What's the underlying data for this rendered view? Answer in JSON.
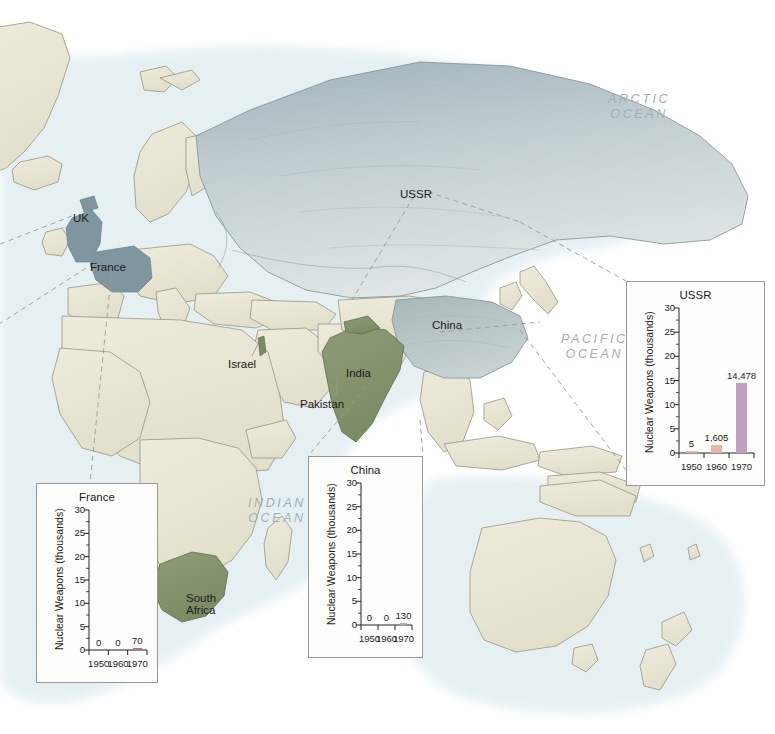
{
  "map": {
    "ocean_labels": [
      {
        "name": "arctic-ocean-label",
        "text": "ARCTIC\nOCEAN",
        "x": 608,
        "y": 92
      },
      {
        "name": "pacific-ocean-label",
        "text": "PACIFIC\nOCEAN",
        "x": 561,
        "y": 332
      },
      {
        "name": "indian-ocean-label",
        "text": "INDIAN\nOCEAN",
        "x": 248,
        "y": 496
      }
    ],
    "country_labels": [
      {
        "name": "country-label-uk",
        "text": "UK",
        "x": 73,
        "y": 212
      },
      {
        "name": "country-label-france",
        "text": "France",
        "x": 90,
        "y": 261
      },
      {
        "name": "country-label-israel",
        "text": "Israel",
        "x": 228,
        "y": 358
      },
      {
        "name": "country-label-ussr",
        "text": "USSR",
        "x": 400,
        "y": 188
      },
      {
        "name": "country-label-china",
        "text": "China",
        "x": 432,
        "y": 319
      },
      {
        "name": "country-label-india",
        "text": "India",
        "x": 346,
        "y": 367
      },
      {
        "name": "country-label-pakistan",
        "text": "Pakistan",
        "x": 300,
        "y": 398
      },
      {
        "name": "country-label-south-africa",
        "text": "South\nAfrica",
        "x": 186,
        "y": 592
      }
    ],
    "colors": {
      "ocean": "#ffffff",
      "coastal_water": "#e4f0f3",
      "land": "#e8e4d3",
      "land_border": "#8f8f7e",
      "highlight_blue": "#8fa3ac",
      "highlight_green": "#7e8f6a",
      "leader_line": "#9a9a96"
    }
  },
  "charts": [
    {
      "panel": "ussr-chart-panel",
      "x": 626,
      "y": 281,
      "w": 139,
      "h": 205,
      "chart_data": {
        "type": "bar",
        "title": "USSR",
        "ylabel": "Nuclear Weapons (thousands)",
        "xlabel": "",
        "categories": [
          "1950",
          "1960",
          "1970"
        ],
        "values": [
          5,
          1605,
          14478
        ],
        "value_labels": [
          "5",
          "1,605",
          "14,478"
        ],
        "yticks": [
          0,
          5,
          10,
          15,
          20,
          25,
          30
        ],
        "ylim": [
          0,
          30
        ],
        "unit_scale": 1000,
        "grid": false,
        "legend": "none",
        "bar_colors": [
          "#e8b4a4",
          "#e8b4a4",
          "#bfa0bf"
        ]
      }
    },
    {
      "panel": "china-chart-panel",
      "x": 308,
      "y": 456,
      "w": 115,
      "h": 202,
      "chart_data": {
        "type": "bar",
        "title": "China",
        "ylabel": "Nuclear Weapons (thousands)",
        "xlabel": "",
        "categories": [
          "1950",
          "1960",
          "1970"
        ],
        "values": [
          0,
          0,
          130
        ],
        "value_labels": [
          "0",
          "0",
          "130"
        ],
        "yticks": [
          0,
          5,
          10,
          15,
          20,
          25,
          30
        ],
        "ylim": [
          0,
          30
        ],
        "unit_scale": 1000,
        "grid": false,
        "legend": "none",
        "bar_colors": [
          "#e8b4a4",
          "#e8b4a4",
          "#bfa0bf"
        ]
      }
    },
    {
      "panel": "france-chart-panel",
      "x": 36,
      "y": 483,
      "w": 122,
      "h": 200,
      "chart_data": {
        "type": "bar",
        "title": "France",
        "ylabel": "Nuclear Weapons (thousands)",
        "xlabel": "",
        "categories": [
          "1950",
          "1960",
          "1970"
        ],
        "values": [
          0,
          0,
          70
        ],
        "value_labels": [
          "0",
          "0",
          "70"
        ],
        "yticks": [
          0,
          5,
          10,
          15,
          20,
          25,
          30
        ],
        "ylim": [
          0,
          30
        ],
        "unit_scale": 1000,
        "grid": false,
        "legend": "none",
        "bar_colors": [
          "#e8b4a4",
          "#e8b4a4",
          "#b8707a"
        ]
      }
    }
  ]
}
